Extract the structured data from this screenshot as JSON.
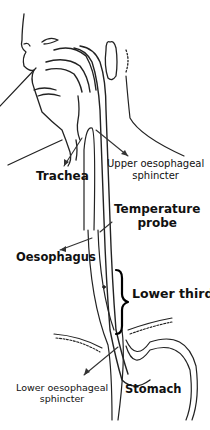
{
  "diagram": {
    "type": "anatomical-illustration",
    "labels": {
      "trachea": "Trachea",
      "upper_sphincter_line1": "Upper oesophageal",
      "upper_sphincter_line2": "sphincter",
      "temperature_probe_line1": "Temperature",
      "temperature_probe_line2": "probe",
      "oesophagus": "Oesophagus",
      "lower_third": "Lower third",
      "lower_sphincter_line1": "Lower oesophageal",
      "lower_sphincter_line2": "sphincter",
      "stomach": "Stomach"
    },
    "colors": {
      "line": "#222222",
      "arrow": "#333333",
      "text": "#111111"
    }
  }
}
